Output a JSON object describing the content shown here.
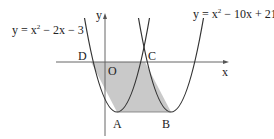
{
  "equations": {
    "left": {
      "prefix": "y = x",
      "exp": "2",
      "suffix": " − 2x − 3"
    },
    "right": {
      "prefix": "y = x",
      "exp": "2",
      "suffix": " − 10x + 21"
    }
  },
  "axes": {
    "x_label": "x",
    "y_label": "y",
    "origin_label": "O"
  },
  "points": {
    "A": "A",
    "B": "B",
    "C": "C",
    "D": "D"
  },
  "colors": {
    "curve": "#333333",
    "axis": "#555555",
    "shade": "#c8c8c8"
  }
}
